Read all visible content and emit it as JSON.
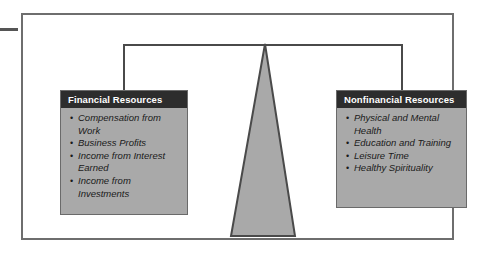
{
  "figure": {
    "type": "balance-scale-diagram",
    "colors": {
      "frame_border": "#6e6e6e",
      "beam": "#4a4a4a",
      "box_body": "#a9a9a9",
      "box_border": "#6a6a6a",
      "header_background": "#2d2d2d",
      "header_text": "#ffffff",
      "body_text": "#1a1a1a",
      "fulcrum_fill": "#a9a9a9",
      "fulcrum_stroke": "#4a4a4a",
      "tick": "#555555"
    },
    "left_panel": {
      "title": "Financial Resources",
      "items": [
        "Compensation from Work",
        "Business Profits",
        "Income from Interest Earned",
        "Income from Investments"
      ]
    },
    "right_panel": {
      "title": "Nonfinancial Resources",
      "items": [
        "Physical and Mental Health",
        "Education and Training",
        "Leisure Time",
        "Healthy Spirituality"
      ]
    }
  }
}
